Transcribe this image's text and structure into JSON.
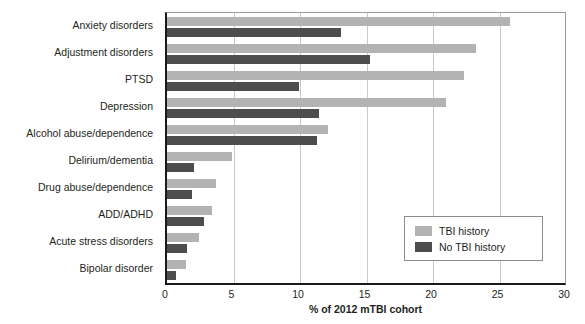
{
  "chart_data": {
    "type": "bar",
    "orientation": "horizontal",
    "title": "",
    "xlabel": "% of 2012 mTBI cohort",
    "ylabel": "",
    "xlim": [
      0,
      30
    ],
    "xticks": [
      0,
      5,
      10,
      15,
      20,
      25,
      30
    ],
    "xticklabels": [
      "0",
      "5",
      "10",
      "15",
      "20",
      "25",
      "30"
    ],
    "grid": "vertical",
    "legend_position": "lower-right",
    "categories": [
      "Anxiety disorders",
      "Adjustment disorders",
      "PTSD",
      "Depression",
      "Alcohol abuse/dependence",
      "Delirium/dementia",
      "Drug abuse/dependence",
      "ADD/ADHD",
      "Acute stress disorders",
      "Bipolar disorder"
    ],
    "series": [
      {
        "name": "TBI history",
        "color": "#b3b3b3",
        "values": [
          25.8,
          23.2,
          22.3,
          21.0,
          12.1,
          4.9,
          3.7,
          3.4,
          2.4,
          1.4
        ]
      },
      {
        "name": "No TBI history",
        "color": "#4d4d4d",
        "values": [
          13.1,
          15.3,
          9.9,
          11.4,
          11.3,
          2.0,
          1.9,
          2.8,
          1.5,
          0.7
        ]
      }
    ]
  },
  "legend": {
    "items": [
      {
        "label": "TBI history",
        "swatch": "light"
      },
      {
        "label": "No TBI history",
        "swatch": "dark"
      }
    ]
  },
  "axis": {
    "x_title": "% of 2012 mTBI cohort"
  }
}
